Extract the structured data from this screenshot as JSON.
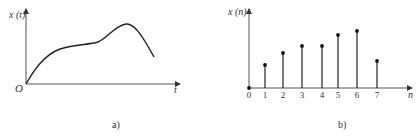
{
  "chart_data": [
    {
      "type": "line",
      "panel_label": "a)",
      "ylabel": "x (t)",
      "xlabel": "t",
      "origin_label": "O",
      "description": "continuous-time signal rising from origin, plateau, peak, then falling",
      "x": [
        0,
        0.1,
        0.2,
        0.3,
        0.4,
        0.5,
        0.6,
        0.7,
        0.78,
        0.9,
        1.0
      ],
      "values": [
        0,
        0.35,
        0.55,
        0.62,
        0.64,
        0.67,
        0.78,
        0.93,
        1.0,
        0.8,
        0.45
      ],
      "grid": false
    },
    {
      "type": "stem",
      "panel_label": "b)",
      "ylabel": "x (n)",
      "xlabel": "n",
      "categories": [
        "0",
        "1",
        "2",
        "3",
        "4",
        "5",
        "6",
        "7"
      ],
      "values": [
        0,
        23,
        35,
        42,
        42,
        53,
        57,
        27
      ],
      "grid": false
    }
  ]
}
